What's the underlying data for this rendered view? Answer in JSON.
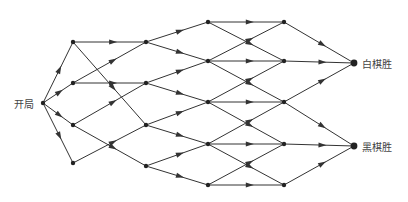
{
  "diagram": {
    "type": "game-tree",
    "edge_color": "#333333",
    "node_color": "#222222",
    "labels": {
      "start": "开局",
      "white_win": "白棋胜",
      "black_win": "黑棋胜"
    },
    "nodes": {
      "start": [
        43,
        103
      ],
      "L1": [
        [
          73,
          42
        ],
        [
          73,
          83
        ],
        [
          73,
          125
        ],
        [
          73,
          163
        ]
      ],
      "L2": [
        [
          146,
          42
        ],
        [
          146,
          83
        ],
        [
          146,
          125
        ],
        [
          146,
          166
        ]
      ],
      "L3": [
        [
          208,
          22
        ],
        [
          208,
          61
        ],
        [
          208,
          102
        ],
        [
          208,
          144
        ],
        [
          208,
          185
        ]
      ],
      "L4": [
        [
          284,
          22
        ],
        [
          284,
          61
        ],
        [
          284,
          102
        ],
        [
          284,
          144
        ],
        [
          284,
          185
        ]
      ],
      "white_win": [
        354,
        63
      ],
      "black_win": [
        354,
        146
      ]
    },
    "edges": [
      [
        "start",
        "L1.0"
      ],
      [
        "start",
        "L1.1"
      ],
      [
        "start",
        "L1.2"
      ],
      [
        "start",
        "L1.3"
      ],
      [
        "L1.0",
        "L2.0"
      ],
      [
        "L1.0",
        "L2.2"
      ],
      [
        "L1.1",
        "L2.0"
      ],
      [
        "L1.1",
        "L2.1"
      ],
      [
        "L1.2",
        "L2.1"
      ],
      [
        "L1.2",
        "L2.3"
      ],
      [
        "L1.3",
        "L2.2"
      ],
      [
        "L2.0",
        "L3.0"
      ],
      [
        "L2.0",
        "L3.1"
      ],
      [
        "L2.1",
        "L3.1"
      ],
      [
        "L2.1",
        "L3.2"
      ],
      [
        "L2.2",
        "L3.2"
      ],
      [
        "L2.2",
        "L3.3"
      ],
      [
        "L2.3",
        "L3.3"
      ],
      [
        "L2.3",
        "L3.4"
      ],
      [
        "L3.0",
        "L4.0"
      ],
      [
        "L3.0",
        "L4.1"
      ],
      [
        "L3.1",
        "L4.0"
      ],
      [
        "L3.1",
        "L4.1"
      ],
      [
        "L3.1",
        "L4.2"
      ],
      [
        "L3.2",
        "L4.1"
      ],
      [
        "L3.2",
        "L4.2"
      ],
      [
        "L3.2",
        "L4.3"
      ],
      [
        "L3.3",
        "L4.2"
      ],
      [
        "L3.3",
        "L4.3"
      ],
      [
        "L3.3",
        "L4.4"
      ],
      [
        "L3.4",
        "L4.3"
      ],
      [
        "L3.4",
        "L4.4"
      ],
      [
        "L4.0",
        "white_win"
      ],
      [
        "L4.1",
        "white_win"
      ],
      [
        "L4.2",
        "white_win"
      ],
      [
        "L4.2",
        "black_win"
      ],
      [
        "L4.3",
        "black_win"
      ],
      [
        "L4.4",
        "black_win"
      ]
    ]
  }
}
